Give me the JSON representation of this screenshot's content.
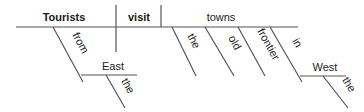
{
  "diagram": {
    "type": "Reed-Kellogg sentence diagram",
    "sentence_words": {
      "subject": "Tourists",
      "verb": "visit",
      "object": "towns",
      "subject_modifier_preposition": "from",
      "subject_modifier_object": "East",
      "subject_modifier_object_article": "the",
      "object_modifier_1": "the",
      "object_modifier_2": "old",
      "object_modifier_3": "frontier",
      "object_modifier_preposition": "in",
      "object_modifier_object": "West",
      "object_modifier_object_article": "the"
    },
    "line_color": "#555555",
    "text_color": "#1a1a1a"
  }
}
